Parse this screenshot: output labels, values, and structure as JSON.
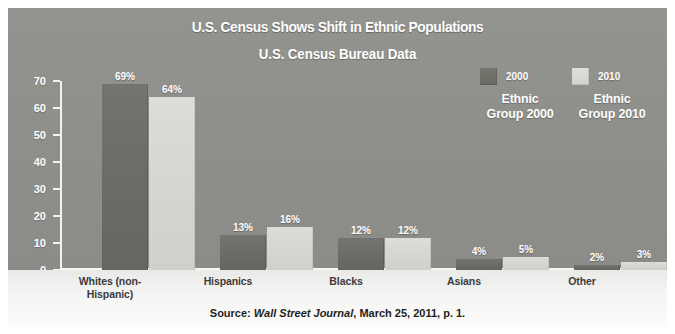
{
  "chart_data": {
    "type": "bar",
    "title": "U.S. Census Shows Shift in Ethnic Populations",
    "subtitle": "U.S. Census Bureau Data",
    "xlabel": "",
    "ylabel": "",
    "ylim": [
      0,
      70
    ],
    "yticks": [
      0,
      10,
      20,
      30,
      40,
      50,
      60,
      70
    ],
    "grid": false,
    "legend_position": "top-right",
    "categories": [
      "Whites (non-Hispanic)",
      "Hispanics",
      "Blacks",
      "Asians",
      "Other"
    ],
    "category_labels": [
      [
        "Whites (non-",
        "Hispanic)"
      ],
      [
        "Hispanics"
      ],
      [
        "Blacks"
      ],
      [
        "Asians"
      ],
      [
        "Other"
      ]
    ],
    "series": [
      {
        "name": "Ethnic Group 2000",
        "year": "2000",
        "color": "#6a6a66",
        "values": [
          69,
          13,
          12,
          4,
          2
        ],
        "value_labels": [
          "69%",
          "13%",
          "12%",
          "4%",
          "2%"
        ]
      },
      {
        "name": "Ethnic Group 2010",
        "year": "2010",
        "color": "#d4d4d0",
        "values": [
          64,
          16,
          12,
          5,
          3
        ],
        "value_labels": [
          "64%",
          "16%",
          "12%",
          "5%",
          "3%"
        ]
      }
    ],
    "source_prefix": "Source: ",
    "source_italic": "Wall Street Journal",
    "source_suffix": ", March 25, 2011, p. 1."
  },
  "legend": {
    "entries": [
      {
        "year": "2000",
        "title_line1": "Ethnic",
        "title_line2": "Group 2000",
        "swatch": "legend-swatch-2000"
      },
      {
        "year": "2010",
        "title_line1": "Ethnic",
        "title_line2": "Group 2010",
        "swatch": "legend-swatch-2010"
      }
    ]
  },
  "axis": {
    "ticks": [
      "70",
      "60",
      "50",
      "40",
      "30",
      "20",
      "10",
      "0"
    ]
  }
}
